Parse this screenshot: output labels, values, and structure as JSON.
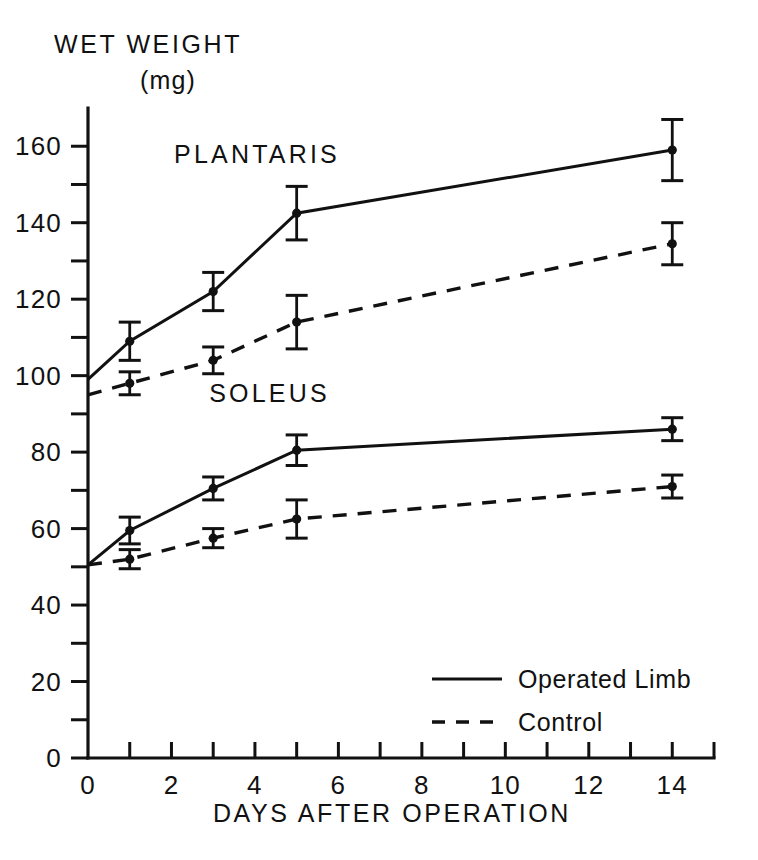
{
  "chart_data": {
    "type": "line",
    "title": "",
    "xlabel": "DAYS AFTER OPERATION",
    "ylabel": "WET WEIGHT",
    "yunit": "(mg)",
    "xlim": [
      0,
      15
    ],
    "ylim": [
      0,
      170
    ],
    "grid": false,
    "x_ticks_major": [
      0,
      2,
      4,
      6,
      8,
      10,
      12,
      14
    ],
    "x_ticks_minor": [
      1,
      3,
      5,
      7,
      9,
      11,
      13,
      15
    ],
    "x_tick_labels": [
      "0",
      "2",
      "4",
      "6",
      "8",
      "10",
      "12",
      "14"
    ],
    "y_ticks_major": [
      0,
      20,
      40,
      60,
      80,
      100,
      120,
      140,
      160
    ],
    "y_ticks_minor": [
      10,
      30,
      50,
      70,
      90,
      110,
      130,
      150
    ],
    "y_tick_labels": [
      "0",
      "20",
      "40",
      "60",
      "80",
      "100",
      "120",
      "140",
      "160"
    ],
    "annotations": [
      {
        "text": "PLANTARIS",
        "x": 4.05,
        "y": 155.5
      },
      {
        "text": "SOLEUS",
        "x": 4.35,
        "y": 93.0
      }
    ],
    "legend": {
      "position": "inside-bottom-right",
      "entries": [
        {
          "label": "Operated Limb",
          "style": "solid"
        },
        {
          "label": "Control",
          "style": "dashed"
        }
      ]
    },
    "series": [
      {
        "name": "Plantaris Operated Limb",
        "muscle": "PLANTARIS",
        "style": "solid",
        "x": [
          0,
          1,
          3,
          5,
          14
        ],
        "values": [
          99,
          109,
          122,
          142.5,
          159
        ],
        "errors": [
          0,
          5,
          5,
          7,
          8
        ],
        "markers": [
          false,
          true,
          true,
          true,
          true
        ]
      },
      {
        "name": "Plantaris Control",
        "muscle": "PLANTARIS",
        "style": "dashed",
        "x": [
          0,
          1,
          3,
          5,
          14
        ],
        "values": [
          95,
          98,
          104,
          114,
          134.5
        ],
        "errors": [
          0,
          3,
          3.5,
          7,
          5.5
        ],
        "markers": [
          false,
          true,
          true,
          true,
          true
        ]
      },
      {
        "name": "Soleus Operated Limb",
        "muscle": "SOLEUS",
        "style": "solid",
        "x": [
          0,
          1,
          3,
          5,
          14
        ],
        "values": [
          50.5,
          59.5,
          70.5,
          80.5,
          86
        ],
        "errors": [
          0,
          3.5,
          3,
          4,
          3
        ],
        "markers": [
          false,
          true,
          true,
          true,
          true
        ]
      },
      {
        "name": "Soleus Control",
        "muscle": "SOLEUS",
        "style": "dashed",
        "x": [
          0,
          1,
          3,
          5,
          14
        ],
        "values": [
          50.5,
          52,
          57.5,
          62.5,
          71
        ],
        "errors": [
          0,
          2.5,
          2.5,
          5,
          3
        ],
        "markers": [
          false,
          true,
          true,
          true,
          true
        ]
      }
    ]
  }
}
